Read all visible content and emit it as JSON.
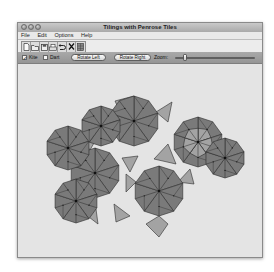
{
  "window": {
    "title": "Tilings with Penrose Tiles"
  },
  "menu": {
    "items": [
      {
        "label": "File"
      },
      {
        "label": "Edit"
      },
      {
        "label": "Options"
      },
      {
        "label": "Help"
      }
    ]
  },
  "toolbar": {
    "buttons": [
      {
        "name": "new-document-icon",
        "glyph": "🗋"
      },
      {
        "name": "open-folder-icon",
        "glyph": "▭"
      },
      {
        "name": "save-disk-icon",
        "glyph": "▣"
      },
      {
        "name": "print-icon",
        "glyph": "⎙"
      },
      {
        "name": "undo-icon",
        "glyph": "↶"
      },
      {
        "name": "cut-icon",
        "glyph": "✕"
      },
      {
        "name": "grid-icon",
        "glyph": "▦"
      }
    ]
  },
  "controls": {
    "kite_label": "Kite",
    "kite_checked": true,
    "kite_check_glyph": "✓",
    "dart_label": "Dart",
    "dart_checked": false,
    "rotate_left_label": "Rotate Left",
    "rotate_right_label": "Rotate Right",
    "zoom_label": "Zoom:",
    "zoom_value_percent": 10
  },
  "tiling": {
    "colors": {
      "kite": "#7a7a7a",
      "dart": "#a3a3a3",
      "edge": "#2b2b2b",
      "canvas": "#e4e4e4"
    },
    "decagons": [
      {
        "cx": 116,
        "cy": 57,
        "r": 25,
        "rot": -90,
        "star": false
      },
      {
        "cx": 77,
        "cy": 109,
        "r": 25,
        "rot": -90,
        "star": false
      },
      {
        "cx": 141,
        "cy": 127,
        "r": 25,
        "rot": -90,
        "star": false
      },
      {
        "cx": 180,
        "cy": 78,
        "r": 25,
        "rot": -90,
        "star": true
      },
      {
        "cx": 50,
        "cy": 84,
        "r": 22,
        "rot": -90,
        "star": false
      },
      {
        "cx": 58,
        "cy": 137,
        "r": 22,
        "rot": -90,
        "star": false
      },
      {
        "cx": 83,
        "cy": 62,
        "r": 20,
        "rot": -90,
        "star": false
      },
      {
        "cx": 207,
        "cy": 94,
        "r": 20,
        "rot": -90,
        "star": false
      }
    ],
    "fill_darts": [
      [
        [
          97,
          37
        ],
        [
          116,
          32
        ],
        [
          103,
          50
        ]
      ],
      [
        [
          62,
          72
        ],
        [
          80,
          72
        ],
        [
          72,
          86
        ]
      ],
      [
        [
          136,
          95
        ],
        [
          150,
          80
        ],
        [
          158,
          100
        ]
      ],
      [
        [
          104,
          94
        ],
        [
          120,
          92
        ],
        [
          112,
          108
        ]
      ],
      [
        [
          96,
          140
        ],
        [
          112,
          152
        ],
        [
          98,
          158
        ]
      ],
      [
        [
          128,
          160
        ],
        [
          141,
          152
        ],
        [
          150,
          160
        ],
        [
          141,
          173
        ]
      ],
      [
        [
          67,
          150
        ],
        [
          78,
          145
        ],
        [
          80,
          160
        ]
      ],
      [
        [
          160,
          118
        ],
        [
          172,
          105
        ],
        [
          176,
          120
        ]
      ],
      [
        [
          138,
          48
        ],
        [
          154,
          38
        ],
        [
          150,
          58
        ]
      ],
      [
        [
          108,
          110
        ],
        [
          118,
          118
        ],
        [
          108,
          128
        ]
      ]
    ]
  }
}
